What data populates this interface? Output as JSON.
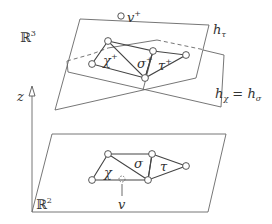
{
  "diagram": {
    "space_labels": {
      "r3": "ℝ",
      "r3_exp": "3",
      "r2": "ℝ",
      "r2_exp": "2"
    },
    "axis": {
      "label": "z"
    },
    "planes": {
      "h_tau": {
        "label": "h",
        "sub": "τ"
      },
      "h_chi_sigma": {
        "label_a": "h",
        "sub_a": "χ",
        "eq": " = ",
        "label_b": "h",
        "sub_b": "σ"
      }
    },
    "lifted": {
      "vertex": {
        "label": "v",
        "sup": "+"
      },
      "chi": {
        "label": "χ",
        "sup": "+"
      },
      "sigma": {
        "label": "σ",
        "sup": "+"
      },
      "tau": {
        "label": "τ",
        "sup": "+"
      }
    },
    "base": {
      "chi": {
        "label": "χ"
      },
      "sigma": {
        "label": "σ"
      },
      "tau": {
        "label": "τ"
      },
      "vertex": {
        "label": "v"
      }
    },
    "colors": {
      "stroke": "#555555",
      "text": "#333333",
      "background": "#ffffff"
    }
  }
}
